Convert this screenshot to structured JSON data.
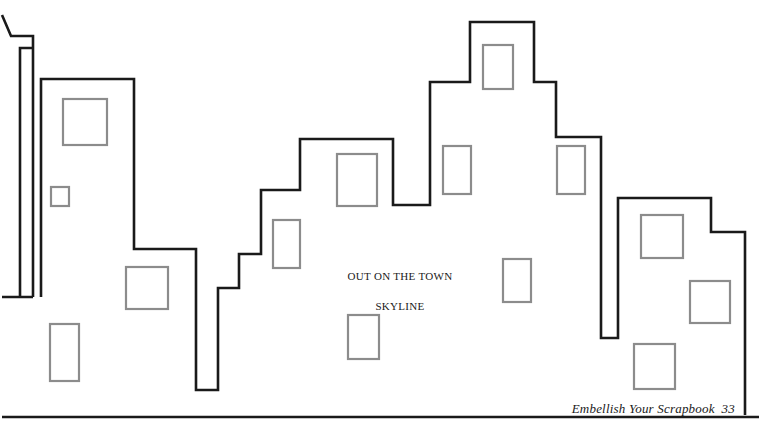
{
  "page": {
    "width": 761,
    "height": 428,
    "background_color": "#ffffff",
    "title_caption": {
      "line1": "OUT ON THE TOWN",
      "line2": "SKYLINE"
    },
    "footer": {
      "credit": "Embellish Your Scrapbook  33"
    }
  },
  "artwork": {
    "name": "city-skyline-outline",
    "description": "Line-art coloring page of a city skyline silhouette with windows",
    "outline_color": "#1a1a1a",
    "outline_width": 2.6,
    "window_color": "#8c8c8c",
    "window_width": 2.2,
    "fill": "none",
    "baseline": {
      "x1": 2,
      "y1": 417,
      "x2": 759,
      "y2": 417
    },
    "skyline_path": "M 2 297 L 20 297 L 20 48 L 33 48 L 33 36 L 11 36 L 2 15 M 20 48 L 20 297 M 33 48 L 33 297 M 20 297 L 33 297 M 41 297 L 41 79 L 134 79 L 134 249 L 196 249 L 196 390 L 218 390 L 218 288 L 239 288 L 239 254 L 261 254 L 261 190 L 300 190 L 300 139 L 393 139 L 393 205 L 430 205 L 430 82 L 470 82 L 470 22 L 534 22 L 534 82 L 556 82 L 556 137 L 601 137 L 601 338 L 618 338 L 618 198 L 711 198 L 711 232 L 745 232 L 745 415",
    "windows": [
      {
        "name": "window-left-upper-large",
        "x": 63,
        "y": 99,
        "w": 44,
        "h": 46
      },
      {
        "name": "window-left-small",
        "x": 51,
        "y": 187,
        "w": 18,
        "h": 19
      },
      {
        "name": "window-left-mid-square",
        "x": 126,
        "y": 267,
        "w": 42,
        "h": 42
      },
      {
        "name": "window-left-lower-tall",
        "x": 50,
        "y": 324,
        "w": 29,
        "h": 57
      },
      {
        "name": "window-mid-narrow",
        "x": 273,
        "y": 220,
        "w": 27,
        "h": 48
      },
      {
        "name": "window-mid-large",
        "x": 337,
        "y": 154,
        "w": 40,
        "h": 52
      },
      {
        "name": "window-mid-lower",
        "x": 348,
        "y": 315,
        "w": 31,
        "h": 44
      },
      {
        "name": "window-tower-top",
        "x": 483,
        "y": 45,
        "w": 30,
        "h": 44
      },
      {
        "name": "window-tower-left",
        "x": 443,
        "y": 146,
        "w": 28,
        "h": 48
      },
      {
        "name": "window-tower-right",
        "x": 557,
        "y": 146,
        "w": 28,
        "h": 48
      },
      {
        "name": "window-tower-center-lower",
        "x": 503,
        "y": 259,
        "w": 28,
        "h": 43
      },
      {
        "name": "window-right-upper",
        "x": 641,
        "y": 215,
        "w": 42,
        "h": 43
      },
      {
        "name": "window-right-middle",
        "x": 690,
        "y": 281,
        "w": 40,
        "h": 42
      },
      {
        "name": "window-right-lower",
        "x": 634,
        "y": 344,
        "w": 41,
        "h": 45
      }
    ]
  }
}
